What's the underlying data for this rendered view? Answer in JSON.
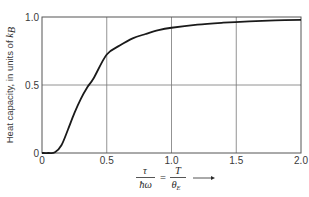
{
  "chart_data": {
    "type": "line",
    "title": "",
    "xlabel": "τ/ħω = T/θ_E →",
    "xlabel_parts": {
      "num1": "τ",
      "den1": "ħω",
      "equals": "=",
      "num2": "T",
      "den2": "θ",
      "den2_sub": "E",
      "arrow": "→"
    },
    "ylabel": "Heat capacity, in units of k_B",
    "ylabel_text": "Heat capacity, in units of ",
    "ylabel_k": "k",
    "ylabel_sub": "B",
    "xlim": [
      0,
      2.0
    ],
    "ylim": [
      0,
      1.0
    ],
    "x_ticks": [
      "0",
      "0.5",
      "1.0",
      "1.5",
      "2.0"
    ],
    "y_ticks": [
      "0",
      "0.5",
      "1.0"
    ],
    "grid": true,
    "legend": null,
    "series": [
      {
        "name": "Einstein heat capacity",
        "x": [
          0.0,
          0.05,
          0.1,
          0.15,
          0.2,
          0.25,
          0.3,
          0.35,
          0.4,
          0.5,
          0.6,
          0.7,
          0.8,
          0.9,
          1.0,
          1.2,
          1.4,
          1.6,
          1.8,
          2.0
        ],
        "y": [
          0.0,
          0.0,
          0.005,
          0.057,
          0.171,
          0.293,
          0.398,
          0.483,
          0.552,
          0.724,
          0.79,
          0.843,
          0.875,
          0.903,
          0.921,
          0.944,
          0.958,
          0.968,
          0.975,
          0.979
        ]
      }
    ],
    "colors": {
      "curve": "#1a1a1a",
      "axes": "#555555",
      "grid": "#777777"
    }
  }
}
